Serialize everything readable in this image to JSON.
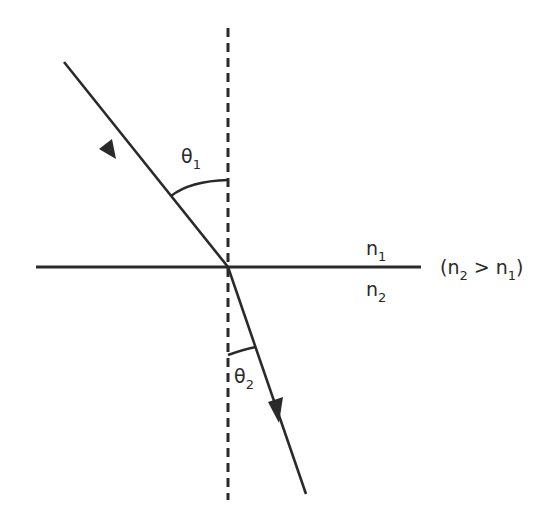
{
  "diagram": {
    "type": "refraction-of-light",
    "colors": {
      "background": "#ffffff",
      "stroke": "#2a2a2a"
    },
    "normal_line": {
      "x": 228,
      "y1": 28,
      "y2": 500,
      "style": "dashed"
    },
    "interface_line": {
      "x1": 36,
      "x2": 421,
      "y": 267
    },
    "incident_ray": {
      "x1": 64,
      "y1": 62,
      "x2": 228,
      "y2": 267,
      "arrow_at": [
        105,
        145
      ]
    },
    "refracted_ray": {
      "x1": 228,
      "y1": 267,
      "x2": 306,
      "y2": 494,
      "arrow_at": [
        275,
        420
      ]
    },
    "labels": {
      "theta1": {
        "symbol": "θ",
        "subscript": "1",
        "x": 181,
        "y": 163
      },
      "theta2": {
        "symbol": "θ",
        "subscript": "2",
        "x": 234,
        "y": 383
      },
      "n1": {
        "symbol": "n",
        "subscript": "1",
        "x": 366,
        "y": 255
      },
      "n2": {
        "symbol": "n",
        "subscript": "2",
        "x": 366,
        "y": 296
      },
      "condition": {
        "open": "(n",
        "sub_a": "2",
        "mid": " > n",
        "sub_b": "1",
        "close": ")",
        "x": 440,
        "y": 274
      }
    }
  }
}
